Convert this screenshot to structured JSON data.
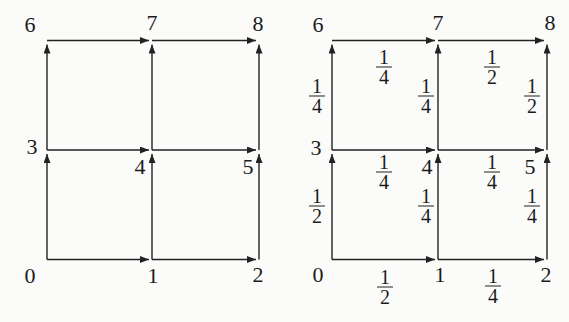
{
  "colors": {
    "line": "#222222",
    "text": "#1b1b1b",
    "background": "#fbfbfa"
  },
  "left_diagram": {
    "node_labels": {
      "n0": "0",
      "n1": "1",
      "n2": "2",
      "n3": "3",
      "n4": "4",
      "n5": "5",
      "n6": "6",
      "n7": "7",
      "n8": "8"
    },
    "edges": [
      "0→1",
      "1→2",
      "3→4",
      "4→5",
      "6→7",
      "7→8",
      "0→3",
      "3→6",
      "1→4",
      "4→7",
      "2→5",
      "5→8"
    ]
  },
  "right_diagram": {
    "node_labels": {
      "n0": "0",
      "n1": "1",
      "n2": "2",
      "n3": "3",
      "n4": "4",
      "n5": "5",
      "n6": "6",
      "n7": "7",
      "n8": "8"
    },
    "edges": [
      "0→1",
      "1→2",
      "3→4",
      "4→5",
      "6→7",
      "7→8",
      "0→3",
      "3→6",
      "1→4",
      "4→7",
      "2→5",
      "5→8"
    ],
    "edge_labels": {
      "e01": {
        "num": "1",
        "den": "2"
      },
      "e12": {
        "num": "1",
        "den": "4"
      },
      "e34": {
        "num": "1",
        "den": "4"
      },
      "e45": {
        "num": "1",
        "den": "4"
      },
      "e67": {
        "num": "1",
        "den": "4"
      },
      "e78": {
        "num": "1",
        "den": "2"
      },
      "e03": {
        "num": "1",
        "den": "2"
      },
      "e36": {
        "num": "1",
        "den": "4"
      },
      "e14": {
        "num": "1",
        "den": "4"
      },
      "e47": {
        "num": "1",
        "den": "4"
      },
      "e25": {
        "num": "1",
        "den": "4"
      },
      "e58": {
        "num": "1",
        "den": "2"
      }
    }
  }
}
